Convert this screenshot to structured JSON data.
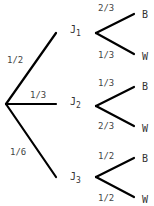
{
  "diagram": {
    "type": "probability-tree",
    "root": {
      "branches": [
        {
          "probability": "1/2",
          "node": "J",
          "node_sub": "1",
          "outcomes": [
            {
              "probability": "2/3",
              "label": "B"
            },
            {
              "probability": "1/3",
              "label": "W"
            }
          ]
        },
        {
          "probability": "1/3",
          "node": "J",
          "node_sub": "2",
          "outcomes": [
            {
              "probability": "1/3",
              "label": "B"
            },
            {
              "probability": "2/3",
              "label": "W"
            }
          ]
        },
        {
          "probability": "1/6",
          "node": "J",
          "node_sub": "3",
          "outcomes": [
            {
              "probability": "1/2",
              "label": "B"
            },
            {
              "probability": "1/2",
              "label": "W"
            }
          ]
        }
      ]
    }
  }
}
